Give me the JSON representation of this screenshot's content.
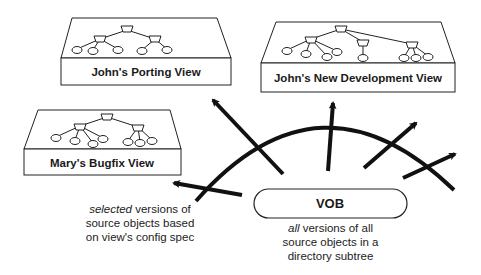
{
  "views": [
    {
      "id": "porting",
      "label": "John's Porting View"
    },
    {
      "id": "new-dev",
      "label": "John's New Development View"
    },
    {
      "id": "bugfix",
      "label": "Mary's Bugfix View"
    }
  ],
  "vob": {
    "label": "VOB",
    "caption_emph": "all",
    "caption_rest_line1": " versions of all",
    "caption_line2": "source objects in a",
    "caption_line3": "directory subtree"
  },
  "selected_caption": {
    "emph": "selected",
    "rest_line1": " versions of",
    "line2": "source objects based",
    "line3": "on view's config spec"
  },
  "colors": {
    "ink": "#111111",
    "background": "#ffffff"
  }
}
